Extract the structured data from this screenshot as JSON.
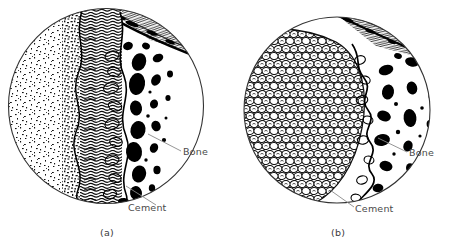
{
  "figure": {
    "type": "scientific-illustration",
    "background_color": "#ffffff",
    "ink_color": "#000000",
    "label_color": "#4a4a4a"
  },
  "panels": [
    {
      "id": "a",
      "caption": "(a)",
      "circle": {
        "cx": 106,
        "cy": 106,
        "r": 98
      },
      "labels": [
        {
          "name": "bone",
          "text": "Bone"
        },
        {
          "name": "cement",
          "text": "Cement"
        }
      ],
      "regions": [
        {
          "name": "stippled-tissue",
          "side": "left"
        },
        {
          "name": "interface-layer",
          "side": "center"
        },
        {
          "name": "bone-trabeculae",
          "side": "right"
        },
        {
          "name": "fibrous-band",
          "side": "top-right"
        }
      ]
    },
    {
      "id": "b",
      "caption": "(b)",
      "circle": {
        "cx": 337,
        "cy": 110,
        "r": 93
      },
      "labels": [
        {
          "name": "bone",
          "text": "Bone"
        },
        {
          "name": "cement",
          "text": "Cement"
        }
      ],
      "regions": [
        {
          "name": "cement-beads",
          "side": "left"
        },
        {
          "name": "interface-layer",
          "side": "center"
        },
        {
          "name": "bone-trabeculae",
          "side": "right"
        },
        {
          "name": "fibrous-band",
          "side": "top-right"
        }
      ]
    }
  ]
}
